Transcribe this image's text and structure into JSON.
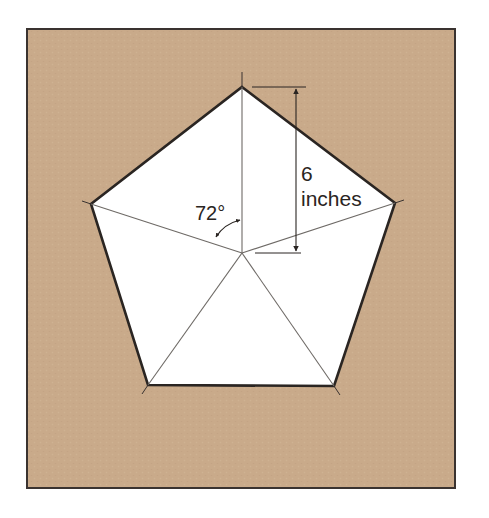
{
  "diagram": {
    "colors": {
      "page_background": "#ffffff",
      "panel_background": "#c9aa8a",
      "panel_border": "#3a3330",
      "pentagon_fill": "#ffffff",
      "pentagon_outline": "#2a2522",
      "radial_lines": "#6e6a66",
      "text": "#2a2522"
    },
    "panel": {
      "x": 27,
      "y": 29,
      "width": 428,
      "height": 459
    },
    "pentagon": {
      "center": [
        242,
        253
      ],
      "vertices": [
        [
          242,
          87
        ],
        [
          395,
          203
        ],
        [
          334,
          386
        ],
        [
          148,
          385
        ],
        [
          91,
          204
        ]
      ]
    },
    "labels": {
      "dimension_value": "6",
      "dimension_unit": "inches",
      "angle": "72°"
    },
    "dimension": {
      "from_vertex": "top",
      "to": "center",
      "length_label": "6 inches"
    },
    "angle_annotation": {
      "value_degrees": 72,
      "between": [
        "center-to-top",
        "center-to-left"
      ]
    }
  }
}
